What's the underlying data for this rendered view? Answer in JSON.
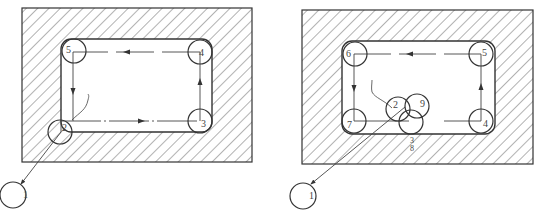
{
  "diagrams": [
    {
      "id": "left",
      "description": "Pocket milling tool path, sequence 1-2-3-4-5",
      "outer_rect": {
        "x": 22,
        "y": 8,
        "w": 230,
        "h": 154
      },
      "pocket": {
        "x": 61,
        "y": 39,
        "w": 151,
        "h": 93,
        "r": 10
      },
      "path_rect": {
        "x1": 73,
        "y1": 52,
        "x2": 200,
        "y2": 121
      },
      "tool_radius": 12,
      "points": [
        {
          "label": "1",
          "cx": 13,
          "cy": 195,
          "r": 13
        },
        {
          "label": "2",
          "cx": 60,
          "cy": 132,
          "r": 12
        },
        {
          "label": "3",
          "cx": 200,
          "cy": 121,
          "r": 12
        },
        {
          "label": "4",
          "cx": 200,
          "cy": 52,
          "r": 12
        },
        {
          "label": "5",
          "cx": 73,
          "cy": 52,
          "r": 12
        }
      ]
    },
    {
      "id": "right",
      "description": "Pocket milling tool path, sequence 1-2-3-4-5-6-7-8-9",
      "outer_rect": {
        "x": 302,
        "y": 10,
        "w": 231,
        "h": 154
      },
      "pocket": {
        "x": 342,
        "y": 41,
        "w": 153,
        "h": 93,
        "r": 10
      },
      "path_rect": {
        "x1": 354,
        "y1": 54,
        "x2": 481,
        "y2": 121
      },
      "tool_radius": 12,
      "points": [
        {
          "label": "1",
          "cx": 303,
          "cy": 196,
          "r": 13
        },
        {
          "label": "2",
          "cx": 398,
          "cy": 109,
          "r": 12
        },
        {
          "label": "9",
          "cx": 417,
          "cy": 106,
          "r": 12
        },
        {
          "label": "3",
          "cx": 411,
          "cy": 122,
          "r": 12
        },
        {
          "label": "4",
          "cx": 481,
          "cy": 121,
          "r": 12
        },
        {
          "label": "5",
          "cx": 481,
          "cy": 54,
          "r": 12
        },
        {
          "label": "6",
          "cx": 354,
          "cy": 54,
          "r": 12
        },
        {
          "label": "7",
          "cx": 354,
          "cy": 121,
          "r": 12
        }
      ],
      "stacked_label": {
        "top": "3",
        "bottom": "8"
      }
    }
  ]
}
